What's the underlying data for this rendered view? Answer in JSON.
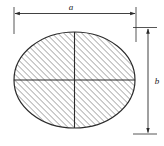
{
  "figure": {
    "name": "ellipse-cross-section-dimension-drawing",
    "type": "engineering-dimension-diagram",
    "background_color": "#ffffff",
    "line_color": "#2b2b2b",
    "hatch_color": "#555555",
    "shape": {
      "name": "ellipse",
      "fill": "hatched",
      "hatch_angle_deg": 45,
      "hatch_spacing_px": 3,
      "center_x": 74.5,
      "center_y": 80,
      "radius_x": 60.5,
      "radius_y": 48
    },
    "axes": {
      "horizontal_centerline": true,
      "vertical_centerline": true
    },
    "dimensions": [
      {
        "name": "width-dimension",
        "label": "a",
        "orientation": "horizontal",
        "position": "top",
        "line_y": 13,
        "from_x": 14,
        "to_x": 136,
        "arrowheads": "both",
        "label_x": 71,
        "label_y": 10
      },
      {
        "name": "height-dimension",
        "label": "b",
        "orientation": "vertical",
        "position": "right",
        "line_x": 148,
        "from_y": 33,
        "to_y": 128,
        "arrowheads": "both",
        "label_x": 155,
        "label_y": 83
      }
    ],
    "extension_lines": [
      {
        "name": "left-extension-line",
        "x1": 14,
        "y1": 7,
        "x2": 14,
        "y2": 33
      },
      {
        "name": "right-extension-line",
        "x1": 136,
        "y1": 7,
        "x2": 136,
        "y2": 40
      },
      {
        "name": "top-extension-line",
        "x1": 132,
        "y1": 27,
        "x2": 155,
        "y2": 27
      },
      {
        "name": "bottom-extension-line",
        "x1": 132,
        "y1": 134,
        "x2": 155,
        "y2": 134
      }
    ]
  }
}
